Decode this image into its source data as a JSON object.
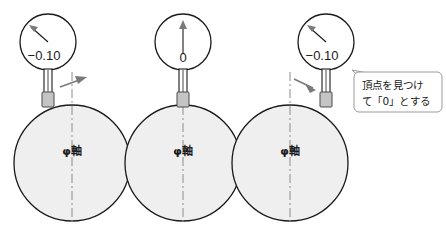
{
  "diagram": {
    "colors": {
      "shaft_fill": "#efefef",
      "outline": "#1a1a1a",
      "centerline": "#8c8c8c",
      "tip_block": "#c4c4c4",
      "move_arrow": "#7a7a7a",
      "callout_border": "#9a9a9a",
      "background": "#ffffff"
    },
    "stages": [
      {
        "id": "stage-left",
        "dial_reading": "−0.10",
        "needle_direction": "up-left",
        "probe_position": "left-of-apex",
        "move_arrow_direction": "right",
        "shaft_label": "φ軸"
      },
      {
        "id": "stage-center",
        "dial_reading": "0",
        "needle_direction": "up",
        "probe_position": "at-apex",
        "move_arrow_direction": "none",
        "shaft_label": "φ軸"
      },
      {
        "id": "stage-right",
        "dial_reading": "−0.10",
        "needle_direction": "up-left",
        "probe_position": "right-of-apex",
        "move_arrow_direction": "left",
        "shaft_label": "φ軸"
      }
    ],
    "callout": {
      "line1": "頂点を見つけ",
      "line2": "て「0」とする"
    }
  }
}
